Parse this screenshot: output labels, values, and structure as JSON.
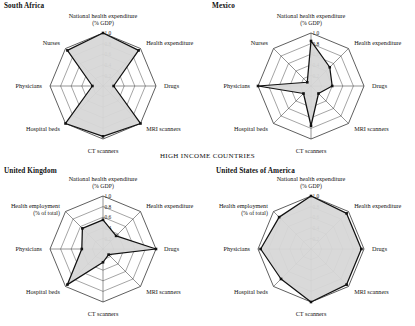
{
  "figure": {
    "section_heading": "HIGH INCOME COUNTRIES",
    "radial_ticks": [
      "1.0",
      "0.8",
      "0.6",
      "0.4",
      "0.2"
    ],
    "tick_values": [
      1.0,
      0.8,
      0.6,
      0.4,
      0.2
    ],
    "colors": {
      "fill": "#d7d7d7",
      "series_stroke": "#111111",
      "grid": "#4a4a4a",
      "axis": "#3a3a3a",
      "background": "#ffffff"
    }
  },
  "chart_data": [
    {
      "type": "radar",
      "title": "South Africa",
      "panel": "top-left",
      "ylim": [
        0,
        1.0
      ],
      "grid": true,
      "legend": "none",
      "categories": [
        "National health expenditure (% GDP)",
        "Health expenditure",
        "Drugs",
        "MRI scanners",
        "CT scanners",
        "Hospital beds",
        "Physicians",
        "Nurses"
      ],
      "category_labels": [
        {
          "line1": "National health expenditure",
          "line2": "(% GDP)"
        },
        {
          "line1": "Health expenditure",
          "line2": ""
        },
        {
          "line1": "Drugs",
          "line2": ""
        },
        {
          "line1": "MRI scanners",
          "line2": ""
        },
        {
          "line1": "CT scanners",
          "line2": ""
        },
        {
          "line1": "Hospital beds",
          "line2": ""
        },
        {
          "line1": "Physicians",
          "line2": ""
        },
        {
          "line1": "Nurses",
          "line2": ""
        }
      ],
      "values": [
        1.0,
        0.95,
        0.2,
        1.0,
        0.95,
        1.0,
        0.2,
        0.95
      ]
    },
    {
      "type": "radar",
      "title": "Mexico",
      "panel": "top-right",
      "ylim": [
        0,
        1.0
      ],
      "grid": true,
      "legend": "none",
      "categories": [
        "National health expenditure (% GDP)",
        "Health expenditure",
        "Drugs",
        "MRI scanners",
        "CT scanners",
        "Hospital beds",
        "Physicians",
        "Nurses"
      ],
      "category_labels": [
        {
          "line1": "National health expenditure",
          "line2": "(% GDP)"
        },
        {
          "line1": "Health expenditure",
          "line2": ""
        },
        {
          "line1": "Drugs",
          "line2": ""
        },
        {
          "line1": "MRI scanners",
          "line2": ""
        },
        {
          "line1": "CT scanners",
          "line2": ""
        },
        {
          "line1": "Hospital beds",
          "line2": ""
        },
        {
          "line1": "Physicians",
          "line2": ""
        },
        {
          "line1": "Nurses",
          "line2": ""
        }
      ],
      "values": [
        0.85,
        0.5,
        0.4,
        0.2,
        0.75,
        0.2,
        1.0,
        0.1
      ]
    },
    {
      "type": "radar",
      "title": "United Kingdom",
      "panel": "bottom-left",
      "ylim": [
        0,
        1.0
      ],
      "grid": true,
      "legend": "none",
      "categories": [
        "National health expenditure (% GDP)",
        "Health expenditure",
        "Drugs",
        "MRI scanners",
        "CT scanners",
        "Hospital beds",
        "Physicians",
        "Health employment (% of total)"
      ],
      "category_labels": [
        {
          "line1": "National health expenditure",
          "line2": "(% GDP)"
        },
        {
          "line1": "Health expenditure",
          "line2": ""
        },
        {
          "line1": "Drugs",
          "line2": ""
        },
        {
          "line1": "MRI scanners",
          "line2": ""
        },
        {
          "line1": "CT scanners",
          "line2": ""
        },
        {
          "line1": "Hospital beds",
          "line2": ""
        },
        {
          "line1": "Physicians",
          "line2": ""
        },
        {
          "line1": "Health employment",
          "line2": "(% of total)"
        }
      ],
      "values": [
        0.55,
        0.35,
        1.0,
        0.15,
        0.25,
        0.95,
        0.4,
        0.55
      ]
    },
    {
      "type": "radar",
      "title": "United States of America",
      "panel": "bottom-right",
      "ylim": [
        0,
        1.0
      ],
      "grid": true,
      "legend": "none",
      "categories": [
        "National health expenditure (% GDP)",
        "Health expenditure",
        "Drugs",
        "MRI scanners",
        "CT scanners",
        "Hospital beds",
        "Physicians",
        "Health employment (% of total)"
      ],
      "category_labels": [
        {
          "line1": "National health expenditure",
          "line2": "(% GDP)"
        },
        {
          "line1": "Health expenditure",
          "line2": ""
        },
        {
          "line1": "Drugs",
          "line2": ""
        },
        {
          "line1": "MRI scanners",
          "line2": ""
        },
        {
          "line1": "CT scanners",
          "line2": ""
        },
        {
          "line1": "Hospital beds",
          "line2": ""
        },
        {
          "line1": "Physicians",
          "line2": ""
        },
        {
          "line1": "Health employment",
          "line2": "(% of total)"
        }
      ],
      "values": [
        1.0,
        0.95,
        0.95,
        0.95,
        1.0,
        0.8,
        0.95,
        0.85
      ]
    }
  ]
}
